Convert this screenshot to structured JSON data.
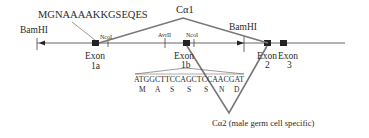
{
  "diagram": {
    "type": "gene-structure",
    "isoform_top": {
      "label": "Cα1"
    },
    "isoform_bottom": {
      "label": "Cα2 (male germ cell specific)"
    },
    "peptide_top": "MGNAAAAKKGSEQES",
    "restriction_sites": [
      {
        "name": "BamHI",
        "position": "left"
      },
      {
        "name": "NcoI",
        "position": "after-exon-1a"
      },
      {
        "name": "AvrII",
        "position": "before-exon-1b"
      },
      {
        "name": "NcoI",
        "position": "after-exon-1b"
      },
      {
        "name": "BamHI",
        "position": "before-exon-2"
      }
    ],
    "exons": [
      {
        "name": "Exon",
        "id": "1a"
      },
      {
        "name": "Exon",
        "id": "1b"
      },
      {
        "name": "Exon",
        "id": "2"
      },
      {
        "name": "Exon",
        "id": "3"
      }
    ],
    "sequence": {
      "dna": "ATGGCTTCCAGCTCCAACGAT",
      "amino_acids": [
        "M",
        "A",
        "S",
        "S",
        "S",
        "N",
        "D"
      ]
    }
  }
}
